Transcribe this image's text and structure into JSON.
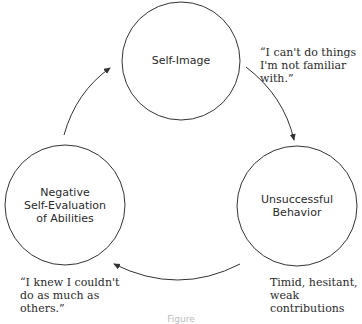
{
  "diagram": {
    "type": "cycle",
    "nodes": [
      {
        "id": "self-image",
        "label": "Self-Image"
      },
      {
        "id": "unsuccessful-behavior",
        "label": "Unsuccessful\nBehavior"
      },
      {
        "id": "negative-self-evaluation",
        "label": "Negative\nSelf-Evaluation\nof Abilities"
      }
    ],
    "edges": [
      {
        "from": "self-image",
        "to": "unsuccessful-behavior"
      },
      {
        "from": "unsuccessful-behavior",
        "to": "negative-self-evaluation"
      },
      {
        "from": "negative-self-evaluation",
        "to": "self-image"
      }
    ],
    "annotations": {
      "self_image_quote": "“I can't do things\nI'm not familiar\nwith.”",
      "behavior_note": "Timid, hesitant,\nweak contributions",
      "evaluation_quote": "“I knew I couldn't\ndo as much as\nothers.”"
    },
    "caption": "Figure"
  },
  "colors": {
    "stroke": "#333333",
    "text": "#2a2a2a",
    "background": "#ffffff"
  }
}
